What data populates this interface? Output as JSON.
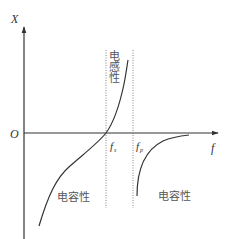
{
  "diagram": {
    "type": "reactance-frequency characteristic",
    "axes": {
      "y_label": "X",
      "x_label": "f",
      "origin_label": "O"
    },
    "markers": {
      "series_resonance": {
        "symbol": "f",
        "subscript": "s"
      },
      "parallel_resonance": {
        "symbol": "f",
        "subscript": "p"
      }
    },
    "regions": {
      "inductive": "电感性",
      "capacitive_left": "电容性",
      "capacitive_right": "电容性"
    },
    "colors": {
      "axis": "#333333",
      "curve": "#333333",
      "guide": "#555555",
      "text": "#555555"
    }
  }
}
